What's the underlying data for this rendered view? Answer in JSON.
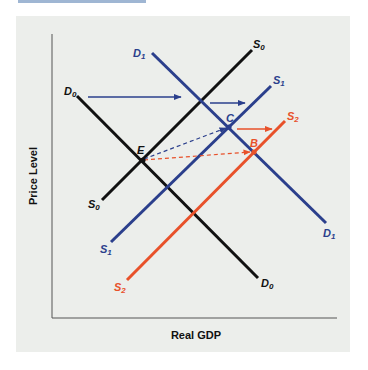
{
  "figure": {
    "title": "",
    "colors": {
      "black": "#111111",
      "blue": "#2b3f8c",
      "orange": "#e8512a",
      "panel_bg": "#eceeeb",
      "top_bar": "#9fb6d3"
    },
    "axes": {
      "x_label": "Real GDP",
      "y_label": "Price Level"
    },
    "curves": [
      {
        "id": "D0",
        "base": "D",
        "sub": "0",
        "type": "demand",
        "color": "black"
      },
      {
        "id": "D1",
        "base": "D",
        "sub": "1",
        "type": "demand",
        "color": "blue"
      },
      {
        "id": "S0",
        "base": "S",
        "sub": "0",
        "type": "supply",
        "color": "black"
      },
      {
        "id": "S1",
        "base": "S",
        "sub": "1",
        "type": "supply",
        "color": "blue"
      },
      {
        "id": "S2",
        "base": "S",
        "sub": "2",
        "type": "supply",
        "color": "orange"
      }
    ],
    "points": [
      {
        "label": "E",
        "desc": "D0 ∩ S0"
      },
      {
        "label": "C",
        "desc": "D1 ∩ S1"
      },
      {
        "label": "B",
        "desc": "D1 ∩ S2"
      }
    ],
    "labels": {
      "D0_left": {
        "base": "D",
        "sub": "0"
      },
      "D0_right": {
        "base": "D",
        "sub": "0"
      },
      "D1_left": {
        "base": "D",
        "sub": "1"
      },
      "D1_right": {
        "base": "D",
        "sub": "1"
      },
      "S0_top": {
        "base": "S",
        "sub": "0"
      },
      "S0_bottom": {
        "base": "S",
        "sub": "0"
      },
      "S1_top": {
        "base": "S",
        "sub": "1"
      },
      "S1_bottom": {
        "base": "S",
        "sub": "1"
      },
      "S2_top": {
        "base": "S",
        "sub": "2"
      },
      "S2_bottom": {
        "base": "S",
        "sub": "2"
      },
      "E": "E",
      "C": "C",
      "B": "B"
    },
    "arrows": [
      {
        "desc": "Demand shift D0 to D1",
        "color": "blue",
        "style": "solid"
      },
      {
        "desc": "Supply shift S0 to S1",
        "color": "blue",
        "style": "solid"
      },
      {
        "desc": "Supply shift S1 to S2",
        "color": "orange",
        "style": "solid"
      },
      {
        "desc": "E to C",
        "color": "blue",
        "style": "dashed"
      },
      {
        "desc": "E to B",
        "color": "orange",
        "style": "dashed"
      }
    ]
  }
}
